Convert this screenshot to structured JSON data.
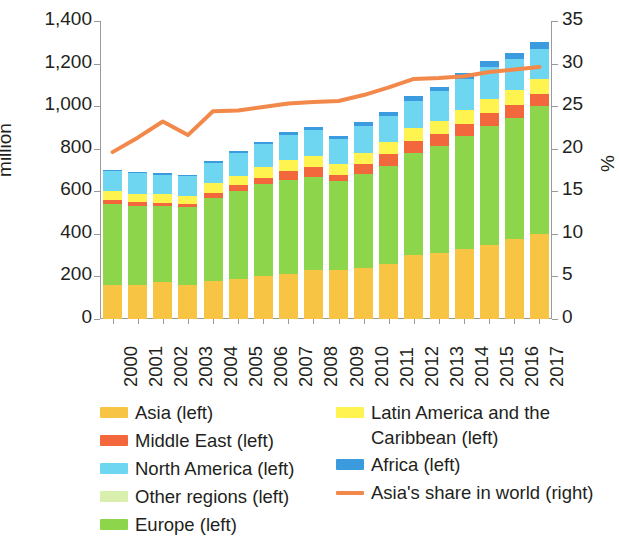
{
  "chart_data": {
    "type": "bar",
    "subtype": "stacked-bar-with-line",
    "title": "",
    "xlabel": "",
    "ylabel": "million",
    "ylabel_right": "%",
    "ylim": [
      0,
      1400
    ],
    "ylim_right": [
      0,
      35
    ],
    "yticks": [
      "0",
      "200",
      "400",
      "600",
      "800",
      "1,000",
      "1,200",
      "1,400"
    ],
    "yticks_right": [
      "0",
      "5",
      "10",
      "15",
      "20",
      "25",
      "30",
      "35"
    ],
    "grid": false,
    "legend_position": "bottom",
    "categories": [
      "2000",
      "2001",
      "2002",
      "2003",
      "2004",
      "2005",
      "2006",
      "2007",
      "2008",
      "2009",
      "2010",
      "2011",
      "2012",
      "2013",
      "2014",
      "2015",
      "2016",
      "2017"
    ],
    "series": [
      {
        "name": "Asia (left)",
        "color": "#F7C543",
        "axis": "left",
        "values": [
          160,
          160,
          172,
          162,
          178,
          190,
          200,
          212,
          228,
          232,
          240,
          260,
          300,
          312,
          330,
          348,
          376,
          400
        ]
      },
      {
        "name": "Europe (left)",
        "color": "#8DD64B",
        "axis": "left",
        "values": [
          380,
          372,
          358,
          362,
          392,
          410,
          432,
          442,
          440,
          418,
          440,
          460,
          480,
          500,
          530,
          560,
          570,
          600
        ]
      },
      {
        "name": "Middle East (left)",
        "color": "#F2673C",
        "axis": "left",
        "values": [
          18,
          16,
          16,
          16,
          24,
          28,
          32,
          42,
          46,
          26,
          48,
          56,
          56,
          56,
          56,
          58,
          58,
          58
        ]
      },
      {
        "name": "Latin America and the Caribbean (left)",
        "color": "#FFF350",
        "axis": "left",
        "values": [
          42,
          40,
          40,
          40,
          44,
          46,
          48,
          52,
          52,
          50,
          54,
          58,
          60,
          62,
          64,
          66,
          70,
          72
        ]
      },
      {
        "name": "North America (left)",
        "color": "#6FD6F2",
        "axis": "left",
        "values": [
          94,
          96,
          92,
          92,
          96,
          106,
          110,
          118,
          120,
          120,
          126,
          120,
          130,
          140,
          150,
          150,
          146,
          140
        ]
      },
      {
        "name": "Africa (left)",
        "color": "#3C9BDE",
        "axis": "left",
        "values": [
          6,
          6,
          6,
          6,
          8,
          10,
          10,
          14,
          14,
          12,
          18,
          18,
          20,
          22,
          26,
          28,
          28,
          30
        ]
      },
      {
        "name": "Other regions (left)",
        "color": "#D8EFAD",
        "axis": "left",
        "values": [
          0,
          0,
          0,
          0,
          0,
          0,
          0,
          0,
          0,
          0,
          0,
          0,
          0,
          0,
          0,
          0,
          0,
          0
        ]
      }
    ],
    "line_series": {
      "name": "Asia's share in world (right)",
      "color": "#F2894A",
      "axis": "right",
      "values": [
        19.6,
        21.3,
        23.2,
        21.6,
        24.4,
        24.5,
        24.9,
        25.3,
        25.5,
        25.6,
        26.3,
        27.2,
        28.2,
        28.3,
        28.5,
        29.0,
        29.3,
        29.6
      ]
    },
    "bar_totals": [
      700,
      690,
      684,
      678,
      742,
      790,
      832,
      880,
      900,
      858,
      926,
      972,
      1046,
      1092,
      1156,
      1210,
      1248,
      1300
    ]
  },
  "axis": {
    "left_title": "million",
    "right_title": "%"
  },
  "legend": {
    "left_column": [
      {
        "label": "Asia (left)",
        "swatch": "#F7C543",
        "kind": "box"
      },
      {
        "label": "Middle East (left)",
        "swatch": "#F2673C",
        "kind": "box"
      },
      {
        "label": "North America (left)",
        "swatch": "#6FD6F2",
        "kind": "box"
      },
      {
        "label": "Other regions (left)",
        "swatch": "#D8EFAD",
        "kind": "box"
      },
      {
        "label": "Europe (left)",
        "swatch": "#8DD64B",
        "kind": "box"
      }
    ],
    "right_column": [
      {
        "label": "Latin America and the Caribbean (left)",
        "swatch": "#FFF350",
        "kind": "box"
      },
      {
        "label": "Africa (left)",
        "swatch": "#3C9BDE",
        "kind": "box"
      },
      {
        "label": "Asia's share in world (right)",
        "swatch": "#F2894A",
        "kind": "line"
      }
    ]
  }
}
